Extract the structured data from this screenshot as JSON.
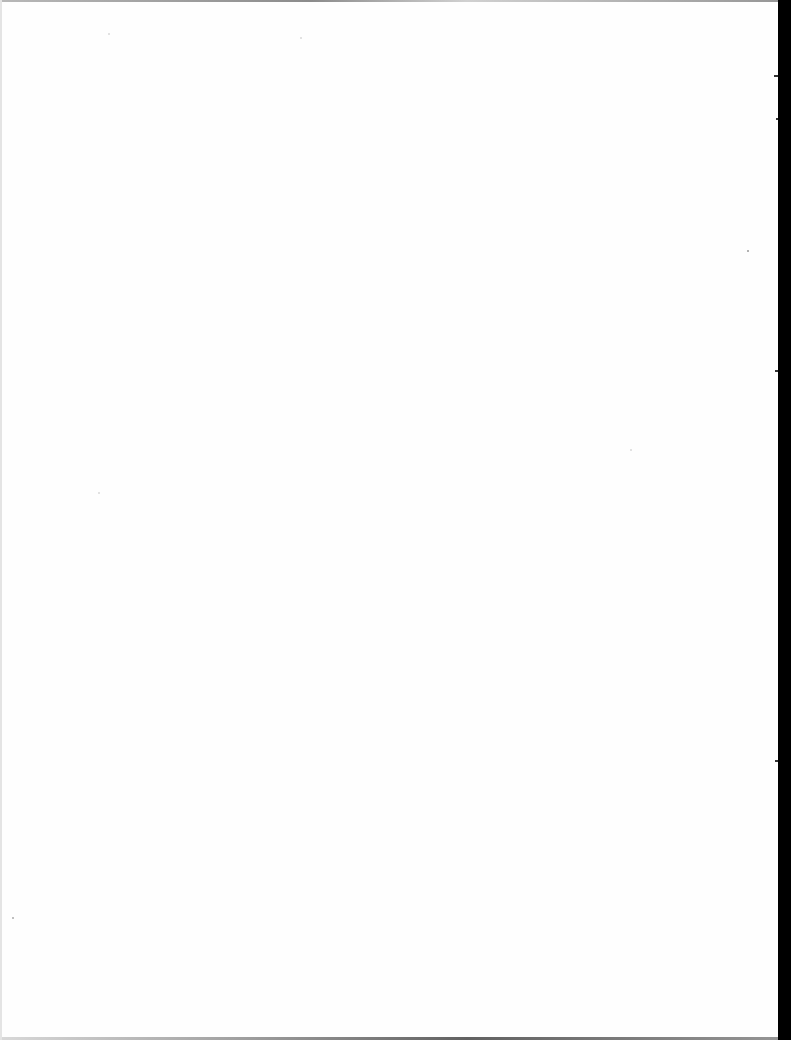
{
  "document": {
    "type": "blank-scanned-page",
    "text": "",
    "colors": {
      "paper": "#fefefe",
      "scanner_edge": "#000000"
    }
  }
}
